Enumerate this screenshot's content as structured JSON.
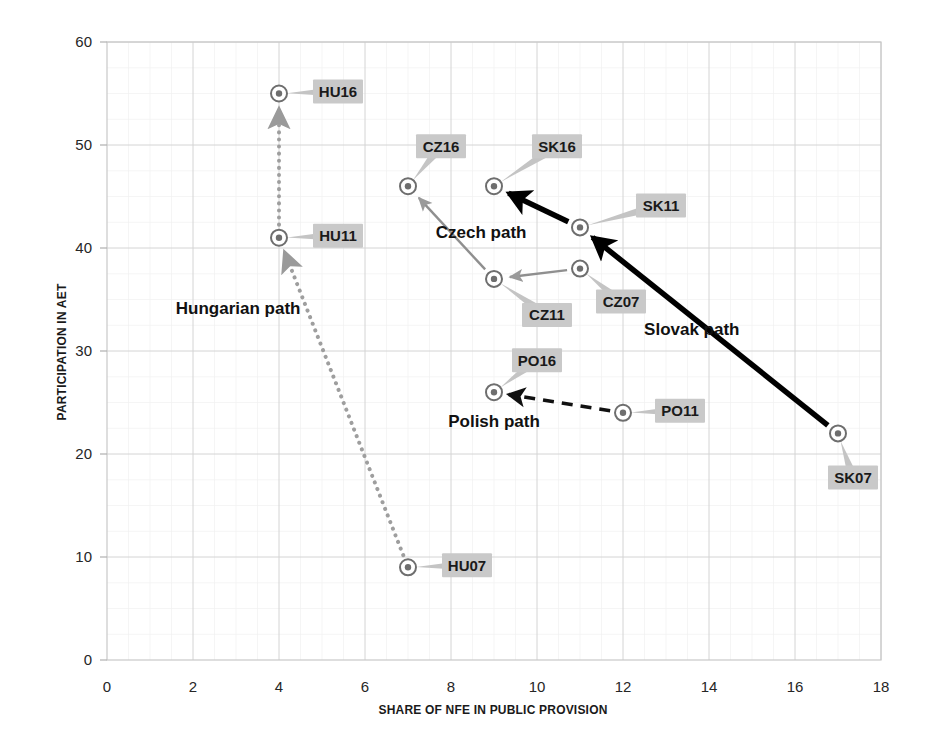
{
  "chart_data": {
    "type": "scatter",
    "title": "",
    "xlabel": "SHARE OF NFE IN PUBLIC PROVISION",
    "ylabel": "PARTICIPATION IN AET",
    "xlim": [
      0,
      18
    ],
    "ylim": [
      0,
      60
    ],
    "xticks": [
      0,
      2,
      4,
      6,
      8,
      10,
      12,
      14,
      16,
      18
    ],
    "yticks": [
      0,
      10,
      20,
      30,
      40,
      50,
      60
    ],
    "grid": true,
    "legend": "none",
    "points": [
      {
        "label": "HU16",
        "x": 4,
        "y": 55,
        "country": "Hungary",
        "year": 2016,
        "label_dx": 34,
        "label_dy": -2
      },
      {
        "label": "HU11",
        "x": 4,
        "y": 41,
        "country": "Hungary",
        "year": 2011,
        "label_dx": 34,
        "label_dy": -2
      },
      {
        "label": "HU07",
        "x": 7,
        "y": 9,
        "country": "Hungary",
        "year": 2007,
        "label_dx": 34,
        "label_dy": -2
      },
      {
        "label": "CZ16",
        "x": 7,
        "y": 46,
        "country": "Czechia",
        "year": 2016,
        "label_dx": 8,
        "label_dy": -40
      },
      {
        "label": "CZ11",
        "x": 9,
        "y": 37,
        "country": "Czechia",
        "year": 2011,
        "label_dx": 28,
        "label_dy": 36
      },
      {
        "label": "CZ07",
        "x": 11,
        "y": 38,
        "country": "Czechia",
        "year": 2007,
        "label_dx": 16,
        "label_dy": 33
      },
      {
        "label": "SK16",
        "x": 9,
        "y": 46,
        "country": "Slovakia",
        "year": 2016,
        "label_dx": 38,
        "label_dy": -40
      },
      {
        "label": "SK11",
        "x": 11,
        "y": 42,
        "country": "Slovakia",
        "year": 2011,
        "label_dx": 56,
        "label_dy": -22
      },
      {
        "label": "SK07",
        "x": 17,
        "y": 22,
        "country": "Slovakia",
        "year": 2007,
        "label_dx": -10,
        "label_dy": 44
      },
      {
        "label": "PO16",
        "x": 9,
        "y": 26,
        "country": "Poland",
        "year": 2016,
        "label_dx": 18,
        "label_dy": -32
      },
      {
        "label": "PO11",
        "x": 12,
        "y": 24,
        "country": "Poland",
        "year": 2011,
        "label_dx": 32,
        "label_dy": -2
      }
    ],
    "paths": [
      {
        "name": "Hungarian path",
        "style": "dotted",
        "color": "#9e9e9e",
        "label_x": 3.05,
        "label_y": 33.6,
        "segments": [
          {
            "from": "HU07",
            "to": "HU11"
          },
          {
            "from": "HU11",
            "to": "HU16"
          }
        ]
      },
      {
        "name": "Czech path",
        "style": "solid-thin",
        "color": "#8f8f8f",
        "label_x": 8.7,
        "label_y": 41.0,
        "segments": [
          {
            "from": "CZ07",
            "to": "CZ11"
          },
          {
            "from": "CZ11",
            "to": "CZ16"
          }
        ]
      },
      {
        "name": "Slovak path",
        "style": "solid-thick",
        "color": "#000000",
        "label_x": 13.6,
        "label_y": 31.6,
        "segments": [
          {
            "from": "SK07",
            "to": "SK11"
          },
          {
            "from": "SK11",
            "to": "SK16"
          }
        ]
      },
      {
        "name": "Polish path",
        "style": "dashed",
        "color": "#111111",
        "label_x": 9.0,
        "label_y": 22.6,
        "segments": [
          {
            "from": "PO11",
            "to": "PO16"
          }
        ]
      }
    ]
  }
}
